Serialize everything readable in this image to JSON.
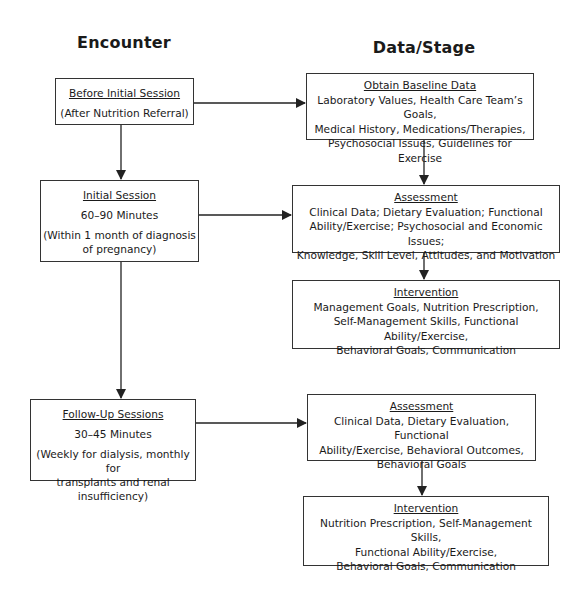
{
  "headers": {
    "encounter": "Encounter",
    "data_stage": "Data/Stage"
  },
  "encounters": [
    {
      "title": "Before Initial Session",
      "lines": [
        "(After Nutrition Referral)"
      ]
    },
    {
      "title": "Initial Session",
      "lines": [
        "60–90 Minutes",
        "(Within 1 month of diagnosis\nof pregnancy)"
      ]
    },
    {
      "title": "Follow-Up Sessions",
      "lines": [
        "30–45 Minutes",
        "(Weekly for dialysis, monthly for\ntransplants and renal insufficiency)"
      ]
    }
  ],
  "stages": [
    {
      "title": "Obtain Baseline Data",
      "body": "Laboratory Values, Health Care Team’s Goals,\nMedical History, Medications/Therapies,\nPsychosocial Issues, Guidelines for Exercise"
    },
    {
      "title": "Assessment",
      "body": "Clinical Data; Dietary Evaluation; Functional\nAbility/Exercise; Psychosocial and Economic Issues;\nKnowledge, Skill Level, Attitudes, and Motivation"
    },
    {
      "title": "Intervention",
      "body": "Management Goals, Nutrition Prescription,\nSelf-Management Skills, Functional Ability/Exercise,\nBehavioral Goals, Communication"
    },
    {
      "title": "Assessment",
      "body": "Clinical Data, Dietary Evaluation, Functional\nAbility/Exercise, Behavioral Outcomes,\nBehavioral Goals"
    },
    {
      "title": "Intervention",
      "body": "Nutrition Prescription, Self-Management Skills,\nFunctional Ability/Exercise,\nBehavioral Goals, Communication"
    }
  ],
  "colors": {
    "line": "#222222",
    "border": "#333333",
    "background": "#ffffff"
  }
}
